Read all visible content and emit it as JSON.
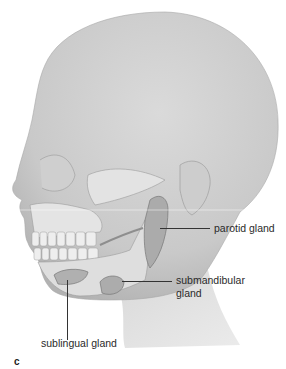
{
  "figure": {
    "panel_letter": "c",
    "colors": {
      "skin": "#d2d2d2",
      "skin_shadow": "#b8b8b8",
      "bone": "#e6e6e6",
      "gland": "#a9a9a9",
      "leader_line": "#333333",
      "text": "#2a2a2a"
    },
    "labels": [
      {
        "id": "parotid",
        "text": "parotid gland"
      },
      {
        "id": "submandibular",
        "text_line1": "submandibular",
        "text_line2": "gland"
      },
      {
        "id": "sublingual",
        "text": "sublingual gland"
      }
    ]
  }
}
